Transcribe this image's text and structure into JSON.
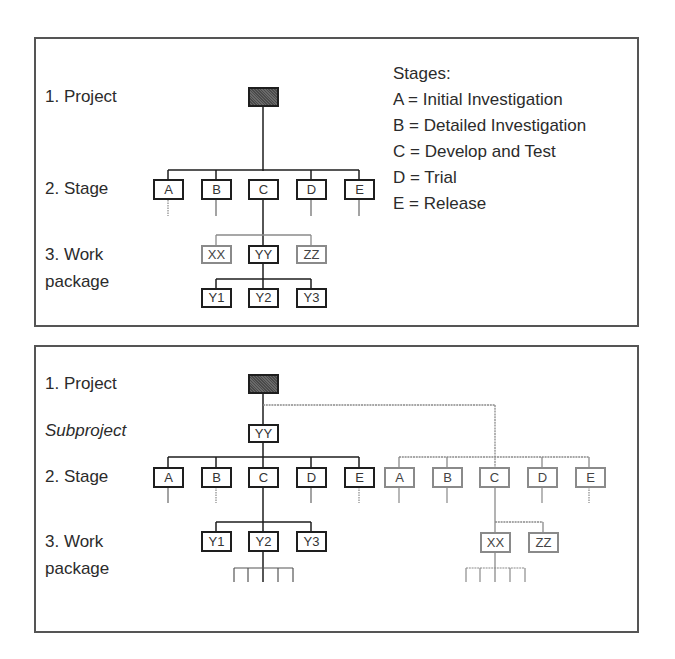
{
  "top_panel": {
    "labels": {
      "project": "1. Project",
      "stage": "2. Stage",
      "work1": "3. Work",
      "work2": "package"
    },
    "legend": {
      "title": "Stages:",
      "items": [
        "A = Initial Investigation",
        "B = Detailed Investigation",
        "C = Develop and Test",
        "D = Trial",
        "E = Release"
      ]
    },
    "stages": [
      "A",
      "B",
      "C",
      "D",
      "E"
    ],
    "work_packages": [
      "XX",
      "YY",
      "ZZ"
    ],
    "sub_packages": [
      "Y1",
      "Y2",
      "Y3"
    ]
  },
  "bottom_panel": {
    "labels": {
      "project": "1. Project",
      "subproject": "Subproject",
      "stage": "2. Stage",
      "work1": "3. Work",
      "work2": "package"
    },
    "subproject": "YY",
    "stages_main": [
      "A",
      "B",
      "C",
      "D",
      "E"
    ],
    "stages_other": [
      "A",
      "B",
      "C",
      "D",
      "E"
    ],
    "work_packages_main": [
      "Y1",
      "Y2",
      "Y3"
    ],
    "work_packages_other": [
      "XX",
      "ZZ"
    ]
  },
  "colors": {
    "solid": "#1e1e1e",
    "gray": "#8a8a8a",
    "project_fill": "#555555"
  }
}
